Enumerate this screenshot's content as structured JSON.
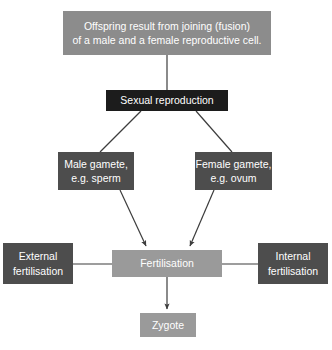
{
  "diagram": {
    "colors": {
      "statement_box": "#8c8c8c",
      "dark_box": "#1c1c1c",
      "mid_box": "#4d4d4d",
      "light_box": "#9a9a9a",
      "connector": "#3d3d3d",
      "text": "#ffffff",
      "background": "#ffffff"
    },
    "nodes": [
      {
        "id": "statement",
        "name": "statement-box",
        "lines": [
          "Offspring result from joining (fusion)",
          "of a male and a female reproductive cell."
        ]
      },
      {
        "id": "sexual_reproduction",
        "name": "sexual-reproduction-box",
        "lines": [
          "Sexual reproduction"
        ]
      },
      {
        "id": "male_gamete",
        "name": "male-gamete-box",
        "lines": [
          "Male gamete,",
          "e.g. sperm"
        ]
      },
      {
        "id": "female_gamete",
        "name": "female-gamete-box",
        "lines": [
          "Female gamete,",
          "e.g. ovum"
        ]
      },
      {
        "id": "external_fertilisation",
        "name": "external-fertilisation-box",
        "lines": [
          "External",
          "fertilisation"
        ]
      },
      {
        "id": "fertilisation",
        "name": "fertilisation-box",
        "lines": [
          "Fertilisation"
        ]
      },
      {
        "id": "internal_fertilisation",
        "name": "internal-fertilisation-box",
        "lines": [
          "Internal",
          "fertilisation"
        ]
      },
      {
        "id": "zygote",
        "name": "zygote-box",
        "lines": [
          "Zygote"
        ]
      }
    ],
    "edges": [
      {
        "from": "statement",
        "to": "sexual_reproduction",
        "arrow": false
      },
      {
        "from": "sexual_reproduction",
        "to": "male_gamete",
        "arrow": false
      },
      {
        "from": "sexual_reproduction",
        "to": "female_gamete",
        "arrow": false
      },
      {
        "from": "male_gamete",
        "to": "fertilisation",
        "arrow": true
      },
      {
        "from": "female_gamete",
        "to": "fertilisation",
        "arrow": true
      },
      {
        "from": "external_fertilisation",
        "to": "fertilisation",
        "arrow": false
      },
      {
        "from": "internal_fertilisation",
        "to": "fertilisation",
        "arrow": false
      },
      {
        "from": "fertilisation",
        "to": "zygote",
        "arrow": true
      }
    ],
    "cut_off_caption": ""
  }
}
